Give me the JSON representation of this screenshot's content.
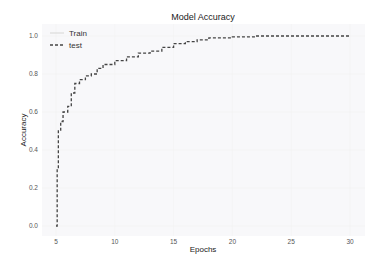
{
  "chart_data": {
    "type": "line",
    "title": "Model Accuracy",
    "xlabel": "Epochs",
    "ylabel": "Accuracy",
    "xlim": [
      4,
      31
    ],
    "ylim": [
      -0.05,
      1.05
    ],
    "xticks": [
      5,
      10,
      15,
      20,
      25,
      30
    ],
    "yticks": [
      0.0,
      0.2,
      0.4,
      0.6,
      0.8,
      1.0
    ],
    "xtick_labels": [
      "5",
      "10",
      "15",
      "20",
      "25",
      "30"
    ],
    "ytick_labels": [
      "0.0",
      "0.2",
      "0.4",
      "0.6",
      "0.8",
      "1.0"
    ],
    "grid": true,
    "legend_position": "upper left",
    "series": [
      {
        "name": "Train",
        "style": "solid",
        "color": "#dddddd",
        "x": [],
        "y": []
      },
      {
        "name": "test",
        "style": "dashed",
        "color": "#444444",
        "x": [
          5.0,
          5.1,
          5.2,
          5.4,
          5.6,
          6.0,
          6.3,
          6.6,
          7.0,
          7.5,
          8.0,
          8.5,
          9.0,
          10.0,
          11.0,
          12.0,
          13.0,
          14.0,
          15.0,
          16.0,
          17.0,
          18.0,
          20.0,
          22.0,
          25.0,
          28.0,
          30.0
        ],
        "y": [
          0.0,
          0.3,
          0.5,
          0.55,
          0.6,
          0.63,
          0.7,
          0.75,
          0.77,
          0.79,
          0.8,
          0.83,
          0.85,
          0.87,
          0.89,
          0.91,
          0.92,
          0.94,
          0.96,
          0.97,
          0.98,
          0.99,
          0.995,
          1.0,
          1.0,
          1.0,
          1.0
        ]
      }
    ]
  }
}
